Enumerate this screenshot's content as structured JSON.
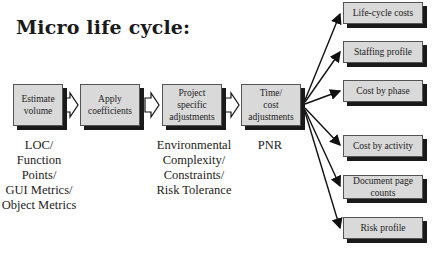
{
  "title": "Micro  life cycle:",
  "stages": [
    {
      "label": "Estimate volume",
      "lines": [
        "Estimate",
        "volume"
      ]
    },
    {
      "label": "Apply coefficients",
      "lines": [
        "Apply",
        "coefficients"
      ]
    },
    {
      "label": "Project specific adjustments",
      "lines": [
        "Project",
        "specific",
        "adjustments"
      ]
    },
    {
      "label": "Time/cost adjustments",
      "lines": [
        "Time/",
        "cost",
        "adjustments"
      ]
    }
  ],
  "stage_inputs": [
    {
      "lines": [
        "LOC/",
        "Function",
        "Points/",
        "GUI Metrics/",
        "Object Metrics"
      ]
    },
    {
      "lines": [
        "Environmental",
        "Complexity/",
        "Constraints/",
        "Risk Tolerance"
      ]
    },
    {
      "lines": [
        "PNR"
      ]
    }
  ],
  "outputs": [
    {
      "lines": [
        "Life-cycle costs"
      ]
    },
    {
      "lines": [
        "Staffing profile"
      ]
    },
    {
      "lines": [
        "Cost by phase"
      ]
    },
    {
      "lines": [
        "Cost by activity"
      ]
    },
    {
      "lines": [
        "Document page",
        "counts"
      ]
    },
    {
      "lines": [
        "Risk profile"
      ]
    }
  ],
  "colors": {
    "box_fill": "#d9d9d9",
    "shadow": "#1a1a1a",
    "text": "#222222"
  }
}
